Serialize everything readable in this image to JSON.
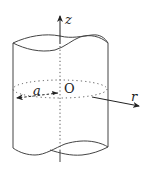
{
  "figure": {
    "labels": {
      "z_axis": "z",
      "r_axis": "r",
      "origin": "O",
      "radius": "a"
    },
    "colors": {
      "stroke": "#333333",
      "background": "#ffffff"
    }
  }
}
